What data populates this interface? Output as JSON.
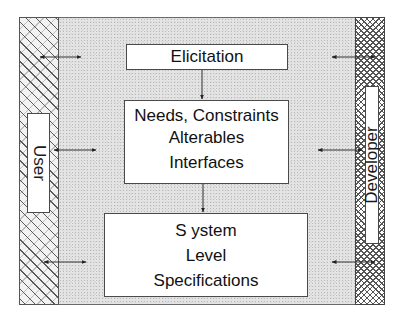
{
  "diagram": {
    "actors": {
      "left": {
        "label": "User"
      },
      "right": {
        "label": "Developer"
      }
    },
    "process_boxes": [
      {
        "id": "elicitation",
        "lines": [
          "Elicitation"
        ]
      },
      {
        "id": "needs",
        "lines": [
          "Needs, Constraints",
          "Alterables",
          "Interfaces"
        ]
      },
      {
        "id": "system",
        "lines": [
          "S ystem",
          "Level",
          "Specifications"
        ]
      }
    ],
    "flows": [
      {
        "from": "elicitation",
        "to": "needs",
        "type": "arrow-down"
      },
      {
        "from": "needs",
        "to": "system",
        "type": "arrow-down"
      }
    ],
    "interactions": [
      {
        "side": "left",
        "level": "elicitation",
        "type": "double-arrow"
      },
      {
        "side": "left",
        "level": "needs",
        "type": "double-arrow"
      },
      {
        "side": "left",
        "level": "system",
        "type": "double-arrow"
      },
      {
        "side": "right",
        "level": "elicitation",
        "type": "double-arrow"
      },
      {
        "side": "right",
        "level": "needs",
        "type": "double-arrow"
      },
      {
        "side": "right",
        "level": "system",
        "type": "double-arrow"
      }
    ],
    "colors": {
      "background_stipple": "#e4e4e4",
      "box_fill": "#ffffff",
      "border": "#4a4a4a",
      "text": "#111111"
    }
  }
}
